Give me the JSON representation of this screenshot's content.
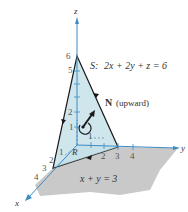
{
  "figure": {
    "surface_label": "S:",
    "surface_equation": "2x + 2y + z = 6",
    "normal_label_bold": "N",
    "normal_label_rest": "(upward)",
    "region_label": "R",
    "region_equation": "x + y = 3",
    "axes": {
      "x": "x",
      "y": "y",
      "z": "z"
    },
    "z_ticks": [
      "1",
      "2",
      "3",
      "4",
      "5",
      "6"
    ],
    "y_ticks": [
      "1",
      "2",
      "3",
      "4"
    ],
    "x_ticks": [
      "1",
      "2",
      "3",
      "4"
    ],
    "colors": {
      "surface_fill": "#cfe6ec",
      "region_fill": "#c8c8c8",
      "axis": "#3c8cc4",
      "edge": "#1a1a1a"
    }
  }
}
